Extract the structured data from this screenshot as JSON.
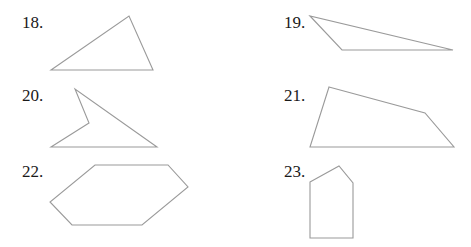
{
  "problems": [
    {
      "number": "18.",
      "shape": "triangle",
      "label_pos": [
        22,
        14
      ],
      "points": "51,70 129,16 153,70"
    },
    {
      "number": "19.",
      "shape": "obtuse-triangle",
      "label_pos": [
        284,
        14
      ],
      "points": "310,16 342,50 453,50"
    },
    {
      "number": "20.",
      "shape": "concave-quadrilateral",
      "label_pos": [
        22,
        87
      ],
      "points": "75,89 89,123 51,147 157,147"
    },
    {
      "number": "21.",
      "shape": "quadrilateral",
      "label_pos": [
        284,
        87
      ],
      "points": "329,87 425,113 454,147 310,147"
    },
    {
      "number": "22.",
      "shape": "hexagon",
      "label_pos": [
        22,
        163
      ],
      "points": "95,165 168,165 188,187 142,225 72,225 50,202"
    },
    {
      "number": "23.",
      "shape": "pentagon",
      "label_pos": [
        284,
        163
      ],
      "points": "310,182 339,166 353,183 353,238 310,238"
    }
  ]
}
